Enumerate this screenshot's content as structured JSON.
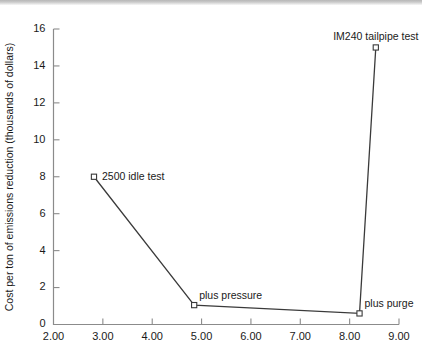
{
  "figure": {
    "name": "cost-per-ton-emissions-reduction-line-chart",
    "top_rule_color": "#b7b7b7",
    "background_color": "#ffffff",
    "line_color": "#3a3a3a",
    "axis_color": "#8b8b8b"
  },
  "chart_data": {
    "type": "line",
    "title": "",
    "xlabel": "",
    "ylabel": "Cost per ton of emissions reduction (thousands of dollars)",
    "xlim": [
      2.0,
      9.0
    ],
    "ylim": [
      0,
      16
    ],
    "grid": false,
    "legend": "none",
    "xticks": [
      2.0,
      3.0,
      4.0,
      5.0,
      6.0,
      7.0,
      8.0,
      9.0
    ],
    "xtick_labels": [
      "2.00",
      "3.00",
      "4.00",
      "5.00",
      "6.00",
      "7.00",
      "8.00",
      "9.00"
    ],
    "yticks": [
      0,
      2,
      4,
      6,
      8,
      10,
      12,
      14,
      16
    ],
    "ytick_labels": [
      "0",
      "2",
      "4",
      "6",
      "8",
      "10",
      "12",
      "14",
      "16"
    ],
    "marker": "open-square",
    "series": [
      {
        "name": "cost per ton",
        "points": [
          {
            "label": "2500 idle test",
            "x": 2.82,
            "y": 8.0,
            "label_pos": "right"
          },
          {
            "label": "plus pressure",
            "x": 4.85,
            "y": 1.05,
            "label_pos": "above-right"
          },
          {
            "label": "plus purge",
            "x": 8.2,
            "y": 0.6,
            "label_pos": "above-right"
          },
          {
            "label": "IM240 tailpipe test",
            "x": 8.53,
            "y": 15.0,
            "label_pos": "above"
          }
        ]
      }
    ],
    "annotations": [
      {
        "text": "2500 idle test",
        "x": 2.82,
        "y": 8.0
      },
      {
        "text": "plus pressure",
        "x": 4.85,
        "y": 1.05
      },
      {
        "text": "plus purge",
        "x": 8.2,
        "y": 0.6
      },
      {
        "text": "IM240 tailpipe test",
        "x": 8.53,
        "y": 15.0
      }
    ]
  }
}
